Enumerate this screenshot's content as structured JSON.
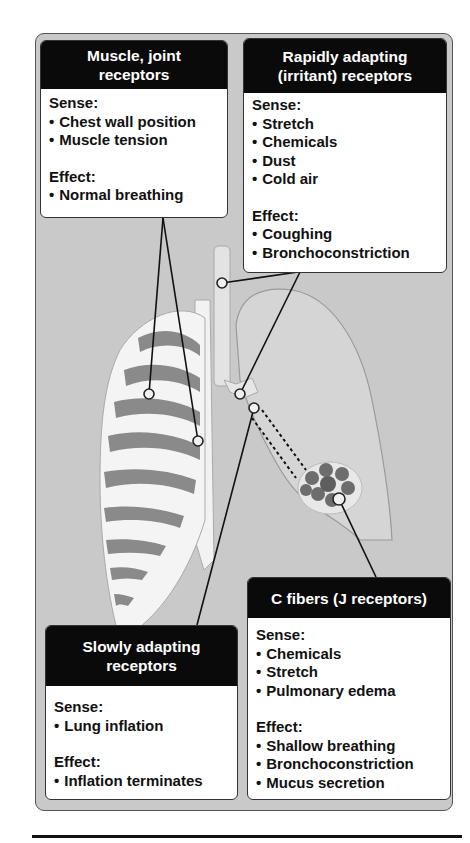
{
  "figure": {
    "background_color": "#c9c9c9",
    "header_color": "#0a0a0a",
    "rib_shade_color": "#8a8a8a",
    "boxes": [
      {
        "id": "muscle-joint",
        "title_lines": [
          "Muscle, joint",
          "receptors"
        ],
        "sense_label": "Sense:",
        "sense": [
          "Chest wall position",
          "Muscle tension"
        ],
        "effect_label": "Effect:",
        "effect": [
          "Normal breathing"
        ]
      },
      {
        "id": "rapidly-adapting",
        "title_lines": [
          "Rapidly adapting",
          "(irritant) receptors"
        ],
        "sense_label": "Sense:",
        "sense": [
          "Stretch",
          "Chemicals",
          "Dust",
          "Cold air"
        ],
        "effect_label": "Effect:",
        "effect": [
          "Coughing",
          "Bronchoconstriction"
        ]
      },
      {
        "id": "slowly-adapting",
        "title_lines": [
          "Slowly adapting",
          "receptors"
        ],
        "sense_label": "Sense:",
        "sense": [
          "Lung inflation"
        ],
        "effect_label": "Effect:",
        "effect": [
          "Inflation terminates"
        ]
      },
      {
        "id": "c-fibers",
        "title_lines": [
          "C fibers (J receptors)"
        ],
        "sense_label": "Sense:",
        "sense": [
          "Chemicals",
          "Stretch",
          "Pulmonary edema"
        ],
        "effect_label": "Effect:",
        "effect": [
          "Shallow breathing",
          "Bronchoconstriction",
          "Mucus secretion"
        ]
      }
    ],
    "illustration": {
      "structures": [
        "rib-cage",
        "sternum",
        "trachea",
        "bronchus",
        "lung",
        "alveoli"
      ],
      "markers": [
        {
          "name": "muscle-marker-1",
          "x": 149,
          "y": 394
        },
        {
          "name": "muscle-marker-2",
          "x": 198,
          "y": 441
        },
        {
          "name": "rapid-marker-trachea",
          "x": 222,
          "y": 283
        },
        {
          "name": "rapid-marker-bronchus",
          "x": 240,
          "y": 394
        },
        {
          "name": "slow-marker",
          "x": 254,
          "y": 408
        },
        {
          "name": "cfiber-marker",
          "x": 339,
          "y": 499
        }
      ]
    }
  }
}
